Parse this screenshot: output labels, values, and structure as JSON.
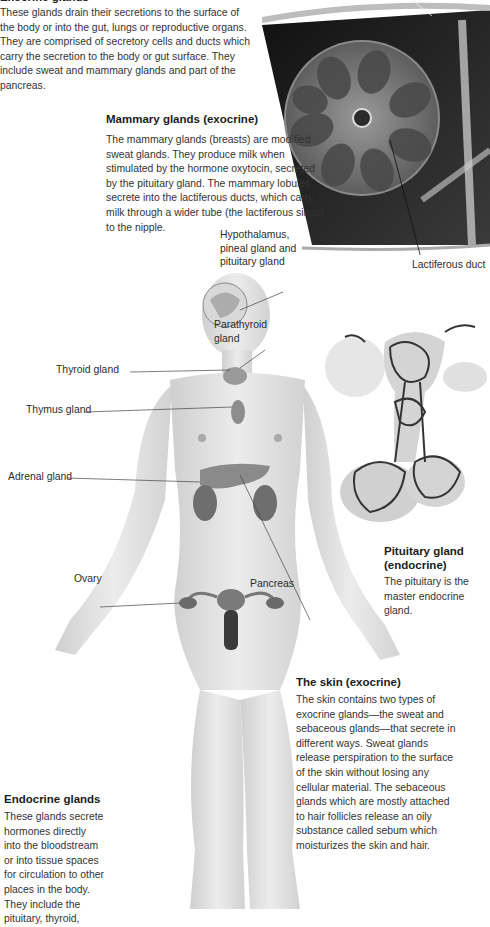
{
  "exocrine_intro": {
    "heading": "Exocrine glands",
    "text": "These glands drain their secretions to the surface of the body or into the gut, lungs or reproductive organs. They are comprised of secretory cells and ducts which carry the secretion to the body or gut surface. They include sweat and mammary glands and part of the pancreas."
  },
  "mammary": {
    "heading": "Mammary glands (exocrine)",
    "text": "The mammary glands (breasts) are modified sweat glands. They produce milk when stimulated by the hormone oxytocin, secreted by the pituitary gland. The mammary lobules secrete into the lactiferous ducts, which carry milk through a wider tube (the lactiferous sinus) to the nipple.",
    "duct_label": "Lactiferous duct"
  },
  "body_labels": {
    "hypothalamus": "Hypothalamus, pineal gland and pituitary gland",
    "parathyroid": "Parathyroid gland",
    "thyroid": "Thyroid gland",
    "thymus": "Thymus gland",
    "adrenal": "Adrenal gland",
    "ovary": "Ovary",
    "pancreas": "Pancreas"
  },
  "pituitary": {
    "heading": "Pituitary gland (endocrine)",
    "text": "The pituitary is the master endocrine gland."
  },
  "skin": {
    "heading": "The skin (exocrine)",
    "text": "The skin contains two types of exocrine glands—the sweat and sebaceous glands—that secrete in different ways. Sweat glands release perspiration to the surface of the skin without losing any cellular material. The sebaceous glands which are mostly attached to hair follicles release an oily substance called sebum which moisturizes the skin and hair."
  },
  "endocrine": {
    "heading": "Endocrine glands",
    "text": "These glands secrete hormones directly into the bloodstream or into tissue spaces for circulation to other places in the body. They include the pituitary, thyroid,"
  },
  "colors": {
    "text": "#333333",
    "heading": "#1c1c1c",
    "skin_tone": "#e6e6e6",
    "organ": "#7a7a7a",
    "dark_tissue": "#2a2a2a"
  }
}
